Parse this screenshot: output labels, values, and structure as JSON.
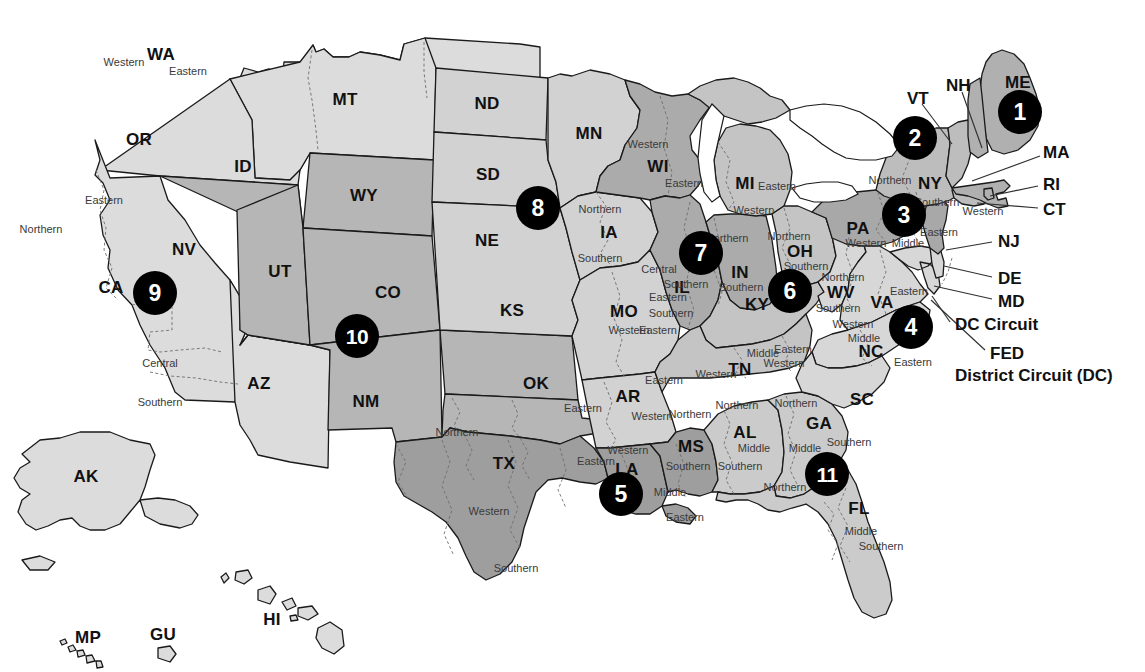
{
  "map": {
    "title": "United States Federal Judicial Circuits and District Courts",
    "colors": {
      "badge_fill": "#000000",
      "badge_text": "#ffffff",
      "outline": "#1a1a1a",
      "district_divider": "#6e6e6e",
      "background": "#ffffff"
    },
    "circuit_badges": [
      {
        "number": "1",
        "x": 1020,
        "y": 112
      },
      {
        "number": "2",
        "x": 915,
        "y": 138
      },
      {
        "number": "3",
        "x": 904,
        "y": 215
      },
      {
        "number": "4",
        "x": 911,
        "y": 327
      },
      {
        "number": "5",
        "x": 621,
        "y": 494
      },
      {
        "number": "6",
        "x": 790,
        "y": 291
      },
      {
        "number": "7",
        "x": 701,
        "y": 253
      },
      {
        "number": "8",
        "x": 538,
        "y": 208
      },
      {
        "number": "9",
        "x": 155,
        "y": 293
      },
      {
        "number": "10",
        "x": 357,
        "y": 336
      },
      {
        "number": "11",
        "x": 827,
        "y": 474
      }
    ],
    "state_labels": [
      {
        "abbr": "WA",
        "x": 161,
        "y": 55
      },
      {
        "abbr": "OR",
        "x": 139,
        "y": 140
      },
      {
        "abbr": "ID",
        "x": 243,
        "y": 167
      },
      {
        "abbr": "MT",
        "x": 345,
        "y": 100
      },
      {
        "abbr": "ND",
        "x": 487,
        "y": 104
      },
      {
        "abbr": "MN",
        "x": 589,
        "y": 134
      },
      {
        "abbr": "SD",
        "x": 488,
        "y": 175
      },
      {
        "abbr": "WY",
        "x": 364,
        "y": 196
      },
      {
        "abbr": "NE",
        "x": 487,
        "y": 241
      },
      {
        "abbr": "IA",
        "x": 609,
        "y": 233
      },
      {
        "abbr": "WI",
        "x": 658,
        "y": 167
      },
      {
        "abbr": "MI",
        "x": 745,
        "y": 184
      },
      {
        "abbr": "NV",
        "x": 184,
        "y": 250
      },
      {
        "abbr": "UT",
        "x": 280,
        "y": 272
      },
      {
        "abbr": "CO",
        "x": 388,
        "y": 293
      },
      {
        "abbr": "KS",
        "x": 512,
        "y": 311
      },
      {
        "abbr": "MO",
        "x": 624,
        "y": 312
      },
      {
        "abbr": "IL",
        "x": 682,
        "y": 288
      },
      {
        "abbr": "IN",
        "x": 740,
        "y": 273
      },
      {
        "abbr": "OH",
        "x": 800,
        "y": 252
      },
      {
        "abbr": "PA",
        "x": 858,
        "y": 229
      },
      {
        "abbr": "NY",
        "x": 930,
        "y": 184
      },
      {
        "abbr": "CA",
        "x": 111,
        "y": 288
      },
      {
        "abbr": "AZ",
        "x": 259,
        "y": 384
      },
      {
        "abbr": "NM",
        "x": 366,
        "y": 402
      },
      {
        "abbr": "OK",
        "x": 536,
        "y": 384
      },
      {
        "abbr": "AR",
        "x": 628,
        "y": 397
      },
      {
        "abbr": "KY",
        "x": 757,
        "y": 305
      },
      {
        "abbr": "TN",
        "x": 740,
        "y": 370
      },
      {
        "abbr": "WV",
        "x": 841,
        "y": 293
      },
      {
        "abbr": "VA",
        "x": 882,
        "y": 303
      },
      {
        "abbr": "NC",
        "x": 871,
        "y": 352
      },
      {
        "abbr": "SC",
        "x": 862,
        "y": 400
      },
      {
        "abbr": "GA",
        "x": 819,
        "y": 424
      },
      {
        "abbr": "AL",
        "x": 745,
        "y": 433
      },
      {
        "abbr": "MS",
        "x": 691,
        "y": 447
      },
      {
        "abbr": "LA",
        "x": 627,
        "y": 470
      },
      {
        "abbr": "TX",
        "x": 504,
        "y": 464
      },
      {
        "abbr": "FL",
        "x": 859,
        "y": 509
      },
      {
        "abbr": "AK",
        "x": 86,
        "y": 477
      },
      {
        "abbr": "HI",
        "x": 272,
        "y": 620
      },
      {
        "abbr": "MP",
        "x": 88,
        "y": 638
      },
      {
        "abbr": "GU",
        "x": 163,
        "y": 635
      }
    ],
    "district_labels": [
      {
        "text": "Western",
        "x": 124,
        "y": 62
      },
      {
        "text": "Eastern",
        "x": 188,
        "y": 71
      },
      {
        "text": "Eastern",
        "x": 104,
        "y": 200
      },
      {
        "text": "Northern",
        "x": 41,
        "y": 229
      },
      {
        "text": "Central",
        "x": 160,
        "y": 363
      },
      {
        "text": "Southern",
        "x": 160,
        "y": 402
      },
      {
        "text": "Northern",
        "x": 600,
        "y": 209
      },
      {
        "text": "Southern",
        "x": 600,
        "y": 258
      },
      {
        "text": "Western",
        "x": 648,
        "y": 144
      },
      {
        "text": "Eastern",
        "x": 684,
        "y": 183
      },
      {
        "text": "Eastern",
        "x": 777,
        "y": 186
      },
      {
        "text": "Western",
        "x": 754,
        "y": 210
      },
      {
        "text": "Northern",
        "x": 727,
        "y": 238
      },
      {
        "text": "Central",
        "x": 659,
        "y": 269
      },
      {
        "text": "Southern",
        "x": 686,
        "y": 284
      },
      {
        "text": "Southern",
        "x": 741,
        "y": 287
      },
      {
        "text": "Southern",
        "x": 671,
        "y": 313
      },
      {
        "text": "Northern",
        "x": 789,
        "y": 236
      },
      {
        "text": "Southern",
        "x": 806,
        "y": 266
      },
      {
        "text": "Western",
        "x": 866,
        "y": 243
      },
      {
        "text": "Middle",
        "x": 908,
        "y": 243
      },
      {
        "text": "Northern",
        "x": 890,
        "y": 180
      },
      {
        "text": "Southern",
        "x": 937,
        "y": 202
      },
      {
        "text": "Western",
        "x": 983,
        "y": 211
      },
      {
        "text": "Eastern",
        "x": 939,
        "y": 232
      },
      {
        "text": "Northern",
        "x": 843,
        "y": 277
      },
      {
        "text": "Southern",
        "x": 838,
        "y": 308
      },
      {
        "text": "Eastern",
        "x": 909,
        "y": 291
      },
      {
        "text": "Western",
        "x": 853,
        "y": 324
      },
      {
        "text": "Middle",
        "x": 864,
        "y": 338
      },
      {
        "text": "Eastern",
        "x": 913,
        "y": 362
      },
      {
        "text": "Western",
        "x": 784,
        "y": 363
      },
      {
        "text": "Eastern",
        "x": 793,
        "y": 349
      },
      {
        "text": "Middle",
        "x": 763,
        "y": 353
      },
      {
        "text": "Western",
        "x": 716,
        "y": 374
      },
      {
        "text": "Western",
        "x": 629,
        "y": 330
      },
      {
        "text": "Eastern",
        "x": 658,
        "y": 330
      },
      {
        "text": "Eastern",
        "x": 668,
        "y": 297
      },
      {
        "text": "Eastern",
        "x": 664,
        "y": 380
      },
      {
        "text": "Western",
        "x": 652,
        "y": 416
      },
      {
        "text": "Northern",
        "x": 690,
        "y": 414
      },
      {
        "text": "Southern",
        "x": 688,
        "y": 466
      },
      {
        "text": "Middle",
        "x": 670,
        "y": 492
      },
      {
        "text": "Eastern",
        "x": 685,
        "y": 517
      },
      {
        "text": "Western",
        "x": 628,
        "y": 450
      },
      {
        "text": "Northern",
        "x": 457,
        "y": 432
      },
      {
        "text": "Eastern",
        "x": 583,
        "y": 408
      },
      {
        "text": "Western",
        "x": 489,
        "y": 511
      },
      {
        "text": "Eastern",
        "x": 596,
        "y": 461
      },
      {
        "text": "Southern",
        "x": 516,
        "y": 568
      },
      {
        "text": "Northern",
        "x": 737,
        "y": 405
      },
      {
        "text": "Middle",
        "x": 754,
        "y": 448
      },
      {
        "text": "Southern",
        "x": 740,
        "y": 466
      },
      {
        "text": "Northern",
        "x": 785,
        "y": 487
      },
      {
        "text": "Northern",
        "x": 796,
        "y": 403
      },
      {
        "text": "Middle",
        "x": 805,
        "y": 448
      },
      {
        "text": "Southern",
        "x": 849,
        "y": 442
      },
      {
        "text": "Middle",
        "x": 861,
        "y": 531
      },
      {
        "text": "Southern",
        "x": 881,
        "y": 546
      }
    ],
    "callouts": [
      {
        "text": "VT",
        "x": 907,
        "y": 99,
        "leader": "M 922 104 L 952 144"
      },
      {
        "text": "NH",
        "x": 946,
        "y": 86,
        "leader": "M 962 92 L 982 148"
      },
      {
        "text": "ME",
        "x": 1005,
        "y": 83
      },
      {
        "text": "MA",
        "x": 1043,
        "y": 153,
        "leader": "M 1040 156 L 972 181"
      },
      {
        "text": "RI",
        "x": 1043,
        "y": 185,
        "leader": "M 1038 186 L 990 196"
      },
      {
        "text": "CT",
        "x": 1043,
        "y": 210,
        "leader": "M 1038 208 L 977 202"
      },
      {
        "text": "NJ",
        "x": 998,
        "y": 242,
        "leader": "M 992 242 L 948 249"
      },
      {
        "text": "DE",
        "x": 998,
        "y": 279,
        "leader": "M 992 277 L 944 267"
      },
      {
        "text": "MD",
        "x": 998,
        "y": 302,
        "leader": "M 992 299 L 935 288"
      },
      {
        "text": "DC Circuit",
        "x": 955,
        "y": 325,
        "leader": "M 950 322 L 932 298"
      },
      {
        "text": "FED",
        "x": 990,
        "y": 354,
        "leader": "M 985 350 L 931 300"
      },
      {
        "text": "District Circuit (DC)",
        "x": 955,
        "y": 376,
        "wide": true
      }
    ]
  }
}
